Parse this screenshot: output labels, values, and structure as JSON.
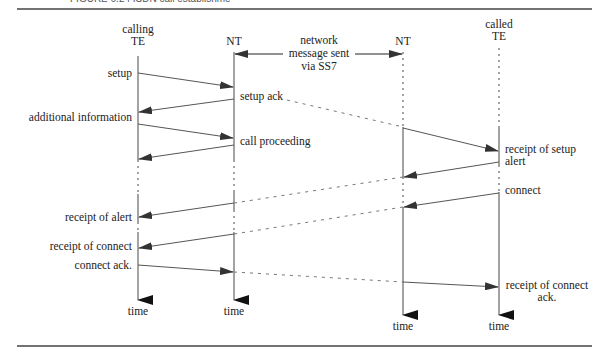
{
  "figure": {
    "caption_partial": "FIGURE 6.24   ISDN call establishment",
    "participants": [
      {
        "id": "calling_te",
        "label_lines": [
          "calling",
          "TE"
        ]
      },
      {
        "id": "nt_left",
        "label_lines": [
          "NT"
        ]
      },
      {
        "id": "nt_right",
        "label_lines": [
          "NT"
        ]
      },
      {
        "id": "called_te",
        "label_lines": [
          "called",
          "TE"
        ]
      }
    ],
    "network_note": {
      "lines": [
        "network",
        "message sent",
        "via SS7"
      ]
    },
    "messages": [
      {
        "label": "setup"
      },
      {
        "label": "setup ack"
      },
      {
        "label": "additional information"
      },
      {
        "label": "call proceeding"
      },
      {
        "label": "receipt of setup"
      },
      {
        "label": "alert"
      },
      {
        "label": "receipt of alert"
      },
      {
        "label": "connect"
      },
      {
        "label": "receipt of connect"
      },
      {
        "label": "connect ack."
      },
      {
        "label_lines": [
          "receipt of connect",
          "ack."
        ]
      }
    ],
    "time_label": "time",
    "colors": {
      "line": "#555555",
      "arrowhead": "#333333",
      "dashed": "#777777",
      "rule": "#444444"
    }
  }
}
